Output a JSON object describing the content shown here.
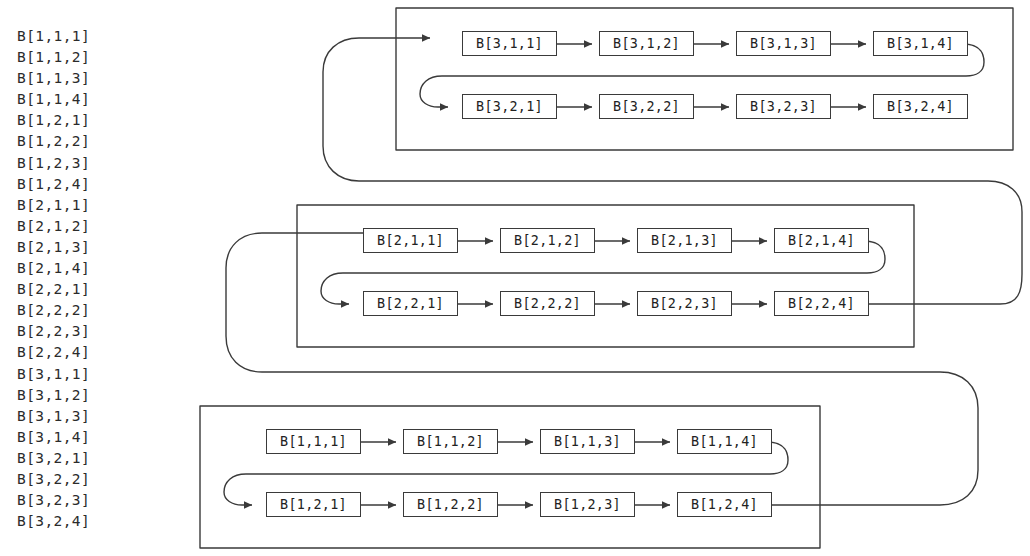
{
  "diagram": {
    "stroke_color": "#3a3a3a",
    "text_color": "#222222",
    "background": "#ffffff"
  },
  "index_list": {
    "name": "linear-index-order",
    "items": [
      "B[1,1,1]",
      "B[1,1,2]",
      "B[1,1,3]",
      "B[1,1,4]",
      "B[1,2,1]",
      "B[1,2,2]",
      "B[1,2,3]",
      "B[1,2,4]",
      "B[2,1,1]",
      "B[2,1,2]",
      "B[2,1,3]",
      "B[2,1,4]",
      "B[2,2,1]",
      "B[2,2,2]",
      "B[2,2,3]",
      "B[2,2,4]",
      "B[3,1,1]",
      "B[3,1,2]",
      "B[3,1,3]",
      "B[3,1,4]",
      "B[3,2,1]",
      "B[3,2,2]",
      "B[3,2,3]",
      "B[3,2,4]"
    ]
  },
  "groups": [
    {
      "name": "group-3",
      "rows": [
        {
          "name": "group-3-row-1",
          "cells": [
            "B[3,1,1]",
            "B[3,1,2]",
            "B[3,1,3]",
            "B[3,1,4]"
          ]
        },
        {
          "name": "group-3-row-2",
          "cells": [
            "B[3,2,1]",
            "B[3,2,2]",
            "B[3,2,3]",
            "B[3,2,4]"
          ]
        }
      ]
    },
    {
      "name": "group-2",
      "rows": [
        {
          "name": "group-2-row-1",
          "cells": [
            "B[2,1,1]",
            "B[2,1,2]",
            "B[2,1,3]",
            "B[2,1,4]"
          ]
        },
        {
          "name": "group-2-row-2",
          "cells": [
            "B[2,2,1]",
            "B[2,2,2]",
            "B[2,2,3]",
            "B[2,2,4]"
          ]
        }
      ]
    },
    {
      "name": "group-1",
      "rows": [
        {
          "name": "group-1-row-1",
          "cells": [
            "B[1,1,1]",
            "B[1,1,2]",
            "B[1,1,3]",
            "B[1,1,4]"
          ]
        },
        {
          "name": "group-1-row-2",
          "cells": [
            "B[1,2,1]",
            "B[1,2,2]",
            "B[1,2,3]",
            "B[1,2,4]"
          ]
        }
      ]
    }
  ]
}
